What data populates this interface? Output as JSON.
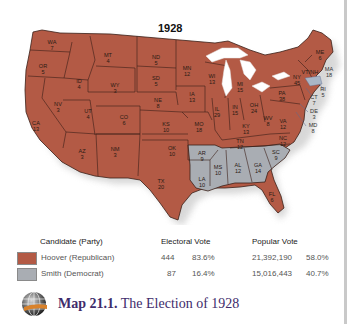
{
  "map": {
    "title": "1928",
    "colors": {
      "republican": "#b35a45",
      "democrat": "#a9adb3",
      "border": "#3a1f18",
      "lakes": "#ffffff",
      "shadow": "#d8d8d8"
    },
    "states": [
      {
        "abbr": "WA",
        "ev": "7",
        "party": "R",
        "x": 52,
        "y": 45
      },
      {
        "abbr": "OR",
        "ev": "5",
        "party": "R",
        "x": 43,
        "y": 69
      },
      {
        "abbr": "CA",
        "ev": "13",
        "party": "R",
        "x": 36,
        "y": 126
      },
      {
        "abbr": "ID",
        "ev": "4",
        "party": "R",
        "x": 79,
        "y": 84
      },
      {
        "abbr": "NV",
        "ev": "3",
        "party": "R",
        "x": 58,
        "y": 107
      },
      {
        "abbr": "MT",
        "ev": "4",
        "party": "R",
        "x": 108,
        "y": 58
      },
      {
        "abbr": "WY",
        "ev": "3",
        "party": "R",
        "x": 115,
        "y": 88
      },
      {
        "abbr": "UT",
        "ev": "4",
        "party": "R",
        "x": 88,
        "y": 114
      },
      {
        "abbr": "CO",
        "ev": "6",
        "party": "R",
        "x": 124,
        "y": 120
      },
      {
        "abbr": "AZ",
        "ev": "3",
        "party": "R",
        "x": 82,
        "y": 154
      },
      {
        "abbr": "NM",
        "ev": "3",
        "party": "R",
        "x": 115,
        "y": 152
      },
      {
        "abbr": "ND",
        "ev": "5",
        "party": "R",
        "x": 156,
        "y": 60
      },
      {
        "abbr": "SD",
        "ev": "5",
        "party": "R",
        "x": 156,
        "y": 81
      },
      {
        "abbr": "NE",
        "ev": "8",
        "party": "R",
        "x": 158,
        "y": 103
      },
      {
        "abbr": "KS",
        "ev": "10",
        "party": "R",
        "x": 166,
        "y": 127
      },
      {
        "abbr": "OK",
        "ev": "10",
        "party": "R",
        "x": 172,
        "y": 151
      },
      {
        "abbr": "TX",
        "ev": "20",
        "party": "R",
        "x": 161,
        "y": 184
      },
      {
        "abbr": "MN",
        "ev": "12",
        "party": "R",
        "x": 187,
        "y": 71
      },
      {
        "abbr": "IA",
        "ev": "13",
        "party": "R",
        "x": 192,
        "y": 97
      },
      {
        "abbr": "MO",
        "ev": "18",
        "party": "R",
        "x": 199,
        "y": 127
      },
      {
        "abbr": "WI",
        "ev": "13",
        "party": "R",
        "x": 212,
        "y": 79
      },
      {
        "abbr": "IL",
        "ev": "29",
        "party": "R",
        "x": 217,
        "y": 112
      },
      {
        "abbr": "MI",
        "ev": "15",
        "party": "R",
        "x": 240,
        "y": 87
      },
      {
        "abbr": "IN",
        "ev": "15",
        "party": "R",
        "x": 235,
        "y": 110
      },
      {
        "abbr": "OH",
        "ev": "24",
        "party": "R",
        "x": 254,
        "y": 108
      },
      {
        "abbr": "KY",
        "ev": "13",
        "party": "R",
        "x": 246,
        "y": 129
      },
      {
        "abbr": "TN",
        "ev": "12",
        "party": "R",
        "x": 240,
        "y": 144
      },
      {
        "abbr": "WV",
        "ev": "8",
        "party": "R",
        "x": 268,
        "y": 121
      },
      {
        "abbr": "VA",
        "ev": "12",
        "party": "R",
        "x": 283,
        "y": 124
      },
      {
        "abbr": "NC",
        "ev": "12",
        "party": "R",
        "x": 283,
        "y": 141
      },
      {
        "abbr": "PA",
        "ev": "38",
        "party": "R",
        "x": 282,
        "y": 96
      },
      {
        "abbr": "NY",
        "ev": "45",
        "party": "R",
        "x": 297,
        "y": 80
      },
      {
        "abbr": "VT/NH",
        "ev": "",
        "party": "R",
        "x": 310,
        "y": 72
      },
      {
        "abbr": "ME",
        "ev": "6",
        "party": "R",
        "x": 320,
        "y": 55
      },
      {
        "abbr": "FL",
        "ev": "6",
        "party": "R",
        "x": 272,
        "y": 197
      },
      {
        "abbr": "AR",
        "ev": "9",
        "party": "D",
        "x": 202,
        "y": 156
      },
      {
        "abbr": "LA",
        "ev": "10",
        "party": "D",
        "x": 202,
        "y": 182
      },
      {
        "abbr": "MS",
        "ev": "10",
        "party": "D",
        "x": 218,
        "y": 170
      },
      {
        "abbr": "AL",
        "ev": "12",
        "party": "D",
        "x": 238,
        "y": 168
      },
      {
        "abbr": "GA",
        "ev": "14",
        "party": "D",
        "x": 258,
        "y": 168
      },
      {
        "abbr": "SC",
        "ev": "9",
        "party": "D",
        "x": 276,
        "y": 155
      }
    ],
    "external_labels": [
      {
        "abbr": "MA",
        "ev": "18",
        "x": 329,
        "y": 72
      },
      {
        "abbr": "RI",
        "ev": "5",
        "x": 323,
        "y": 92
      },
      {
        "abbr": "CT",
        "ev": "7",
        "x": 314,
        "y": 100
      },
      {
        "abbr": "DE",
        "ev": "3",
        "x": 314,
        "y": 114
      },
      {
        "abbr": "MD",
        "ev": "8",
        "x": 313,
        "y": 128
      }
    ]
  },
  "legend": {
    "headers": {
      "candidate": "Candidate (Party)",
      "electoral": "Electoral Vote",
      "popular": "Popular Vote"
    },
    "rows": [
      {
        "candidate": "Hoover (Republican)",
        "swatch_color": "#b35a45",
        "ev": "444",
        "ev_pct": "83.6%",
        "popular": "21,392,190",
        "pop_pct": "58.0%"
      },
      {
        "candidate": "Smith (Democrat)",
        "swatch_color": "#a9adb3",
        "ev": "87",
        "ev_pct": "16.4%",
        "popular": "15,016,443",
        "pop_pct": "40.7%"
      }
    ]
  },
  "caption": {
    "icon": "globe-icon",
    "label": "Map 21.1.",
    "text": " The Election of 1928"
  }
}
